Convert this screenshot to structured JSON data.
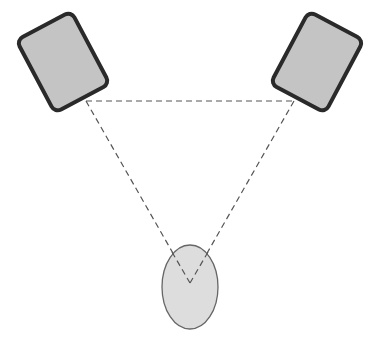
{
  "diagram": {
    "title": "",
    "colors": {
      "background": "#ffffff",
      "speaker_fill": "#c4c4c4",
      "speaker_stroke": "#2a2a2a",
      "listener_fill": "#dddddd",
      "listener_stroke": "#666666",
      "dash_line": "#555555"
    },
    "nodes": [
      {
        "id": "left-speaker",
        "type": "speaker",
        "label": ""
      },
      {
        "id": "right-speaker",
        "type": "speaker",
        "label": ""
      },
      {
        "id": "listener",
        "type": "listener-head",
        "label": ""
      }
    ],
    "edges": [
      {
        "from": "left-speaker",
        "to": "right-speaker",
        "style": "dashed"
      },
      {
        "from": "left-speaker",
        "to": "listener",
        "style": "dashed"
      },
      {
        "from": "right-speaker",
        "to": "listener",
        "style": "dashed"
      }
    ]
  }
}
